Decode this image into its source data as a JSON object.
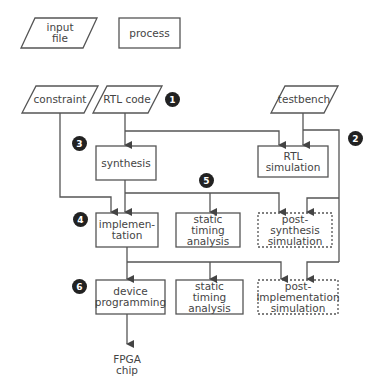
{
  "legend": {
    "input_file": "input\nfile",
    "process": "process"
  },
  "inputs": {
    "constraint": "constraint",
    "rtl_code": "RTL code",
    "testbench": "testbench"
  },
  "processes": {
    "synthesis": "synthesis",
    "rtl_simulation": "RTL\nsimulation",
    "implementation": "implemen-\ntation",
    "sta_1": "static\ntiming\nanalysis",
    "post_synthesis_sim": "post-synthesis\nsimulation",
    "device_programming": "device\nprogramming",
    "sta_2": "static\ntiming\nanalysis",
    "post_impl_sim": "post-\nimplementation\nsimulation"
  },
  "output": {
    "fpga_chip": "FPGA\nchip"
  },
  "badges": [
    "1",
    "2",
    "3",
    "4",
    "5",
    "6"
  ],
  "colors": {
    "line": "#444444",
    "badge": "#222222"
  }
}
